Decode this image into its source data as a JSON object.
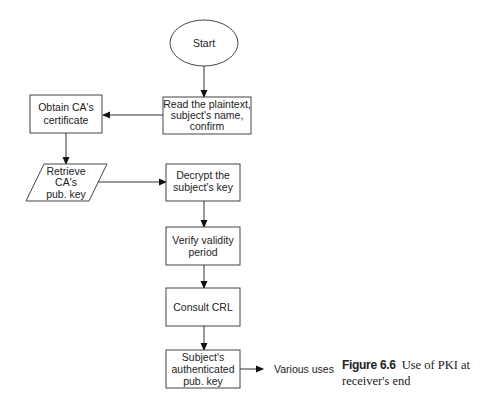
{
  "diagram": {
    "type": "flowchart",
    "nodes": [
      {
        "id": "start",
        "shape": "ellipse",
        "lines": [
          "Start"
        ]
      },
      {
        "id": "read",
        "shape": "rect",
        "lines": [
          "Read  the plaintext,",
          "subject's name,",
          "confirm"
        ]
      },
      {
        "id": "obtain",
        "shape": "rect",
        "lines": [
          "Obtain CA's",
          "certificate"
        ]
      },
      {
        "id": "retrieve",
        "shape": "parallelogram",
        "lines": [
          "Retrieve",
          "CA's",
          "pub. key"
        ]
      },
      {
        "id": "decrypt",
        "shape": "rect",
        "lines": [
          "Decrypt the",
          "subject's key"
        ]
      },
      {
        "id": "verify",
        "shape": "rect",
        "lines": [
          "Verify validity",
          "period"
        ]
      },
      {
        "id": "consult",
        "shape": "rect",
        "lines": [
          "Consult CRL"
        ]
      },
      {
        "id": "subject",
        "shape": "rect",
        "lines": [
          "Subject's",
          "authenticated",
          "pub. key"
        ]
      }
    ],
    "edges": [
      {
        "from": "start",
        "to": "read"
      },
      {
        "from": "read",
        "to": "obtain"
      },
      {
        "from": "obtain",
        "to": "retrieve"
      },
      {
        "from": "retrieve",
        "to": "decrypt"
      },
      {
        "from": "decrypt",
        "to": "verify"
      },
      {
        "from": "verify",
        "to": "consult"
      },
      {
        "from": "consult",
        "to": "subject"
      },
      {
        "from": "subject",
        "to": "various_uses"
      }
    ],
    "output_label": "Various uses"
  },
  "caption": {
    "figure_number": "Figure 6.6",
    "text": "Use of PKI at receiver's end"
  }
}
